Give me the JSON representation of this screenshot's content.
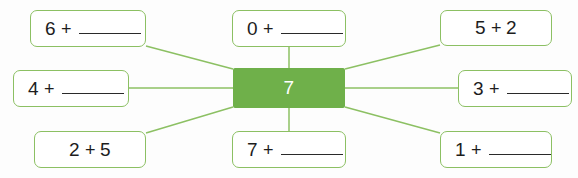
{
  "worksheet": {
    "center": {
      "value": "7",
      "color": "#6fb04a",
      "text_color": "#ffffff",
      "x": 233,
      "y": 68,
      "w": 112,
      "h": 40
    },
    "accent_color": "#8cc063",
    "line_color": "#8cc063",
    "cards": [
      {
        "id": "card-top-left",
        "first": "6",
        "plus": "+",
        "answer": "",
        "has_blank": true,
        "align": "left",
        "x": 30,
        "y": 10,
        "w": 116,
        "h": 37
      },
      {
        "id": "card-middle-left",
        "first": "4",
        "plus": "+",
        "answer": "",
        "has_blank": true,
        "align": "left",
        "x": 13,
        "y": 70,
        "w": 116,
        "h": 37
      },
      {
        "id": "card-bottom-left",
        "first": "2",
        "plus": "+",
        "answer": "5",
        "has_blank": false,
        "align": "center",
        "x": 34,
        "y": 131,
        "w": 112,
        "h": 37
      },
      {
        "id": "card-top-center",
        "first": "0",
        "plus": "+",
        "answer": "",
        "has_blank": true,
        "align": "left",
        "x": 232,
        "y": 10,
        "w": 114,
        "h": 37
      },
      {
        "id": "card-bottom-center",
        "first": "7",
        "plus": "+",
        "answer": "",
        "has_blank": true,
        "align": "left",
        "x": 232,
        "y": 131,
        "w": 114,
        "h": 37
      },
      {
        "id": "card-top-right",
        "first": "5",
        "plus": "+",
        "answer": "2",
        "has_blank": false,
        "align": "center",
        "x": 440,
        "y": 10,
        "w": 112,
        "h": 36
      },
      {
        "id": "card-middle-right",
        "first": "3",
        "plus": "+",
        "answer": "",
        "has_blank": true,
        "align": "left",
        "x": 458,
        "y": 70,
        "w": 114,
        "h": 37
      },
      {
        "id": "card-bottom-right",
        "first": "1",
        "plus": "+",
        "answer": "",
        "has_blank": true,
        "align": "left",
        "x": 440,
        "y": 131,
        "w": 112,
        "h": 37
      }
    ],
    "connectors": [
      {
        "id": "line-top-left",
        "x1": 146,
        "y1": 46,
        "x2": 233,
        "y2": 69
      },
      {
        "id": "line-middle-left",
        "x1": 129,
        "y1": 88,
        "x2": 233,
        "y2": 88
      },
      {
        "id": "line-bottom-left",
        "x1": 146,
        "y1": 133,
        "x2": 233,
        "y2": 107
      },
      {
        "id": "line-top-center",
        "x1": 289,
        "y1": 47,
        "x2": 289,
        "y2": 69
      },
      {
        "id": "line-bottom-center",
        "x1": 289,
        "y1": 107,
        "x2": 289,
        "y2": 131
      },
      {
        "id": "line-top-right",
        "x1": 345,
        "y1": 69,
        "x2": 440,
        "y2": 45
      },
      {
        "id": "line-middle-right",
        "x1": 345,
        "y1": 88,
        "x2": 458,
        "y2": 88
      },
      {
        "id": "line-bottom-right",
        "x1": 345,
        "y1": 107,
        "x2": 440,
        "y2": 133
      }
    ]
  }
}
